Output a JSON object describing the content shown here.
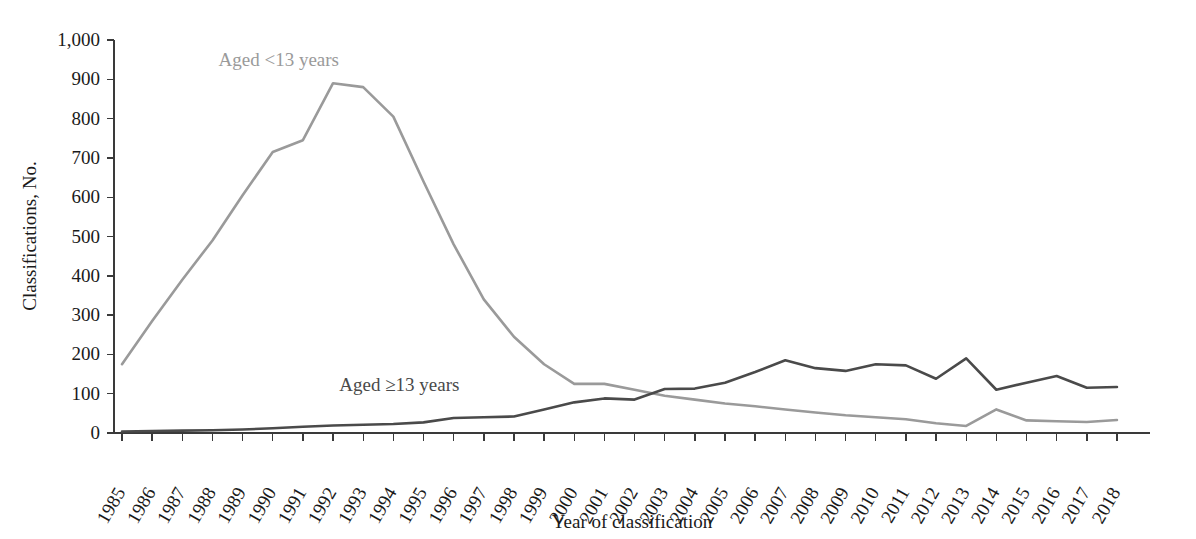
{
  "chart_data": {
    "type": "line",
    "title": "",
    "xlabel": "Year of classification",
    "ylabel": "Classifications, No.",
    "ylim": [
      0,
      1000
    ],
    "yticks": [
      0,
      100,
      200,
      300,
      400,
      500,
      600,
      700,
      800,
      900,
      1000
    ],
    "ytick_labels": [
      "0",
      "100",
      "200",
      "300",
      "400",
      "500",
      "600",
      "700",
      "800",
      "900",
      "1,000"
    ],
    "grid": false,
    "legend": "inline-labels",
    "categories": [
      1985,
      1986,
      1987,
      1988,
      1989,
      1990,
      1991,
      1992,
      1993,
      1994,
      1995,
      1996,
      1997,
      1998,
      1999,
      2000,
      2001,
      2002,
      2003,
      2004,
      2005,
      2006,
      2007,
      2008,
      2009,
      2010,
      2011,
      2012,
      2013,
      2014,
      2015,
      2016,
      2017,
      2018
    ],
    "xtick_labels": [
      "1985",
      "1986",
      "1987",
      "1988",
      "1989",
      "1990",
      "1991",
      "1992",
      "1993",
      "1994",
      "1995",
      "1996",
      "1997",
      "1998",
      "1999",
      "2000",
      "2001",
      "2002",
      "2003",
      "2004",
      "2005",
      "2006",
      "2007",
      "2008",
      "2009",
      "2010",
      "2011",
      "2012",
      "2013",
      "2014",
      "2015",
      "2016",
      "2017",
      "2018"
    ],
    "series": [
      {
        "name": "Aged <13 years",
        "label": "Aged <13 years",
        "color": "#9a9a9a",
        "label_x": 1990.2,
        "label_y": 935,
        "values": [
          175,
          285,
          390,
          490,
          605,
          715,
          745,
          890,
          880,
          805,
          640,
          480,
          340,
          245,
          175,
          125,
          125,
          110,
          95,
          85,
          75,
          68,
          60,
          52,
          45,
          40,
          35,
          25,
          18,
          60,
          32,
          30,
          28,
          33
        ]
      },
      {
        "name": "Aged ≥13 years",
        "label": "Aged ≥13 years",
        "color": "#4a4a4a",
        "label_x": 1994.2,
        "label_y": 108,
        "values": [
          4,
          5,
          6,
          7,
          9,
          12,
          16,
          19,
          21,
          23,
          27,
          38,
          40,
          42,
          60,
          78,
          88,
          85,
          112,
          113,
          128,
          155,
          185,
          165,
          158,
          175,
          172,
          138,
          190,
          110,
          128,
          145,
          115,
          117
        ]
      }
    ]
  },
  "axes": {
    "y_axis_title": "Classifications, No.",
    "x_axis_title": "Year of classification"
  }
}
